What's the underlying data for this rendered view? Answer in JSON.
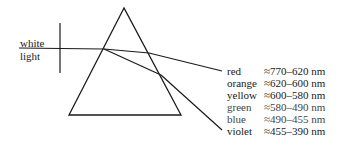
{
  "diagram": {
    "incoming_light": {
      "label_line1": "white",
      "label_line2": "light"
    },
    "spectrum": [
      {
        "color": "red",
        "range": "≈770–620 nm"
      },
      {
        "color": "orange",
        "range": "≈620–600 nm"
      },
      {
        "color": "yellow",
        "range": "≈600–580 nm"
      },
      {
        "color": "green",
        "range": "≈580–490 nm"
      },
      {
        "color": "blue",
        "range": "≈490–455 nm"
      },
      {
        "color": "violet",
        "range": "≈455–390 nm"
      }
    ],
    "colors": {
      "ink": "#1a1a1a",
      "background": "#ffffff"
    }
  }
}
